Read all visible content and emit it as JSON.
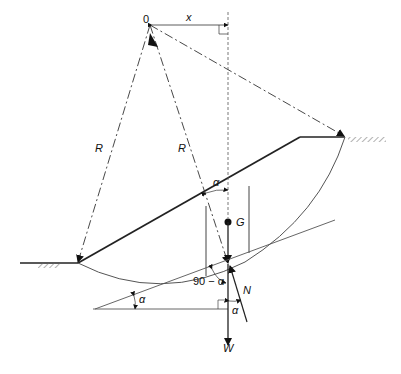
{
  "diagram": {
    "title": "",
    "labels": {
      "center": "0",
      "x": "x",
      "radius_left": "R",
      "radius_right": "R",
      "alpha_top": "α",
      "gravity": "G",
      "angle_90": "90 − α",
      "normal": "N",
      "alpha_left": "α",
      "alpha_bottom": "α",
      "weight": "W"
    },
    "colors": {
      "line": "#222222",
      "thin": "#555555"
    }
  }
}
